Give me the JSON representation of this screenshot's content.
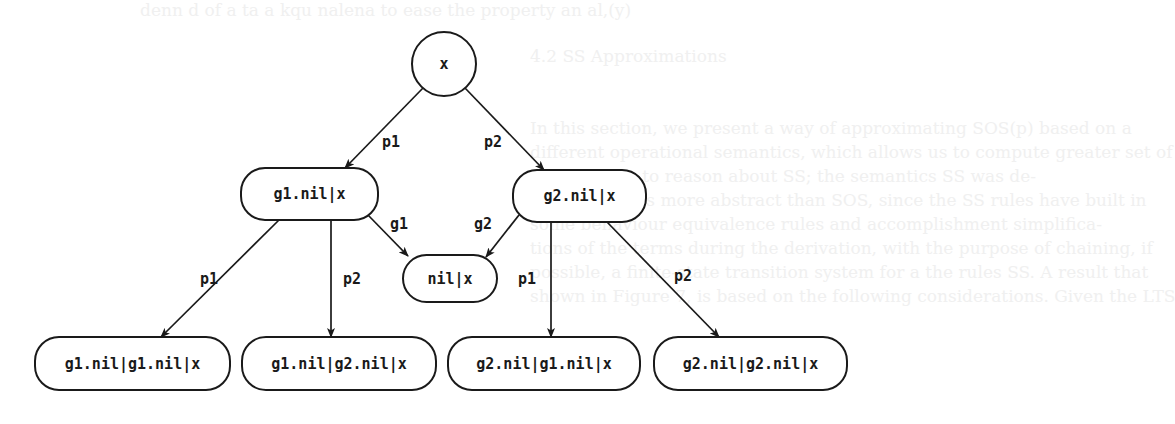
{
  "background_text": [
    {
      "text": "denn d of a ta a kqu nalena to ease the property an al,(y)",
      "x": 140,
      "y": 14
    },
    {
      "text": "4.2  SS Approximations",
      "x": 530,
      "y": 60
    },
    {
      "text": "In this section, we present a way of approximating SOS(p) based on a",
      "x": 530,
      "y": 132
    },
    {
      "text": "different operational semantics, which allows us to compute greater set of",
      "x": 530,
      "y": 156
    },
    {
      "text": "experiments to reason about SS; the semantics SS was de-",
      "x": 530,
      "y": 180
    },
    {
      "text": "fined, which is more abstract than SOS, since the SS rules have built in",
      "x": 530,
      "y": 204
    },
    {
      "text": "some behaviour equivalence rules and accomplishment simplifica-",
      "x": 530,
      "y": 228
    },
    {
      "text": "tions of the terms during the derivation, with the purpose of chaining, if",
      "x": 530,
      "y": 252
    },
    {
      "text": "possible, a finite-state transition system for a the rules SS. A result that",
      "x": 530,
      "y": 276
    },
    {
      "text": "shown in Figure 7, is based on the following considerations. Given the LTS",
      "x": 530,
      "y": 300
    }
  ],
  "diagram": {
    "root": {
      "id": "x",
      "label": "x",
      "shape": "circle",
      "cx": 444,
      "cy": 64,
      "r": 32
    },
    "nodes": [
      {
        "id": "g1x",
        "label": "g1.nil|x",
        "x": 241,
        "y": 168,
        "w": 137,
        "h": 52
      },
      {
        "id": "g2x",
        "label": "g2.nil|x",
        "x": 513,
        "y": 170,
        "w": 133,
        "h": 52
      },
      {
        "id": "nilx",
        "label": "nil|x",
        "x": 403,
        "y": 255,
        "w": 94,
        "h": 47
      },
      {
        "id": "g1g1",
        "label": "g1.nil|g1.nil|x",
        "x": 35,
        "y": 337,
        "w": 195,
        "h": 53
      },
      {
        "id": "g1g2",
        "label": "g1.nil|g2.nil|x",
        "x": 242,
        "y": 337,
        "w": 194,
        "h": 53
      },
      {
        "id": "g2g1",
        "label": "g2.nil|g1.nil|x",
        "x": 448,
        "y": 337,
        "w": 192,
        "h": 53
      },
      {
        "id": "g2g2",
        "label": "g2.nil|g2.nil|x",
        "x": 654,
        "y": 337,
        "w": 193,
        "h": 53
      }
    ],
    "edges": [
      {
        "from": "x",
        "to": "g1x",
        "label": "p1",
        "x1": 423,
        "y1": 88,
        "x2": 345,
        "y2": 168,
        "lx": 382,
        "ly": 147
      },
      {
        "from": "x",
        "to": "g2x",
        "label": "p2",
        "x1": 465,
        "y1": 88,
        "x2": 544,
        "y2": 170,
        "lx": 484,
        "ly": 147
      },
      {
        "from": "g1x",
        "to": "nilx",
        "label": "g1",
        "x1": 367,
        "y1": 214,
        "x2": 408,
        "y2": 256,
        "lx": 390,
        "ly": 229
      },
      {
        "from": "g2x",
        "to": "nilx",
        "label": "g2",
        "x1": 519,
        "y1": 215,
        "x2": 486,
        "y2": 257,
        "lx": 474,
        "ly": 229
      },
      {
        "from": "g1x",
        "to": "g1g1",
        "label": "p1",
        "x1": 279,
        "y1": 220,
        "x2": 161,
        "y2": 337,
        "lx": 200,
        "ly": 284
      },
      {
        "from": "g1x",
        "to": "g1g2",
        "label": "p2",
        "x1": 331,
        "y1": 220,
        "x2": 331,
        "y2": 337,
        "lx": 343,
        "ly": 284
      },
      {
        "from": "g2x",
        "to": "g2g1",
        "label": "p1",
        "x1": 551,
        "y1": 222,
        "x2": 551,
        "y2": 337,
        "lx": 518,
        "ly": 284
      },
      {
        "from": "g2x",
        "to": "g2g2",
        "label": "p2",
        "x1": 607,
        "y1": 222,
        "x2": 719,
        "y2": 337,
        "lx": 674,
        "ly": 281
      }
    ]
  }
}
